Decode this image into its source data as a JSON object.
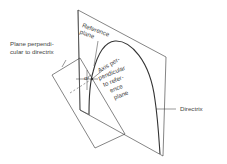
{
  "diagram": {
    "labels": {
      "reference_plane": [
        "Reference",
        "plane"
      ],
      "plane_perpendicular": [
        "Plane perpendi-",
        "cular to directrix"
      ],
      "axis": [
        "Axis per-",
        "pendicular",
        "to refer-",
        "ence",
        "plane"
      ],
      "directrix": "Directrix",
      "angle_symbol": "α"
    },
    "colors": {
      "line": "#333333",
      "text": "#444444",
      "background": "#ffffff"
    }
  }
}
